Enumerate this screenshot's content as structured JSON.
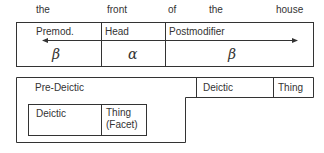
{
  "words": [
    "the",
    "front",
    "of",
    "the",
    "house"
  ],
  "top_box": {
    "labels": [
      "Premod.",
      "Head",
      "Postmodifier"
    ],
    "greek": [
      "β",
      "α",
      "β"
    ]
  },
  "lower": {
    "pre_deictic": "Pre-Deictic",
    "right_cells": [
      "Deictic",
      "Thing"
    ],
    "inner_cells": [
      "Deictic",
      "Thing",
      "(Facet)"
    ]
  }
}
